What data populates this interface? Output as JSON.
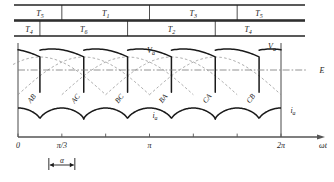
{
  "figure": {
    "type": "waveform-timing-diagram"
  },
  "thyristor_rows": {
    "upper": {
      "name": "upper-thyristor-row",
      "segments": [
        {
          "label": "T5",
          "start": 0.0,
          "end": 0.1667
        },
        {
          "label": "T1",
          "start": 0.1667,
          "end": 0.5
        },
        {
          "label": "T3",
          "start": 0.5,
          "end": 0.8333
        },
        {
          "label": "T5",
          "start": 0.8333,
          "end": 1.0
        }
      ]
    },
    "lower": {
      "name": "lower-thyristor-row",
      "segments": [
        {
          "label": "T4",
          "start": 0.0,
          "end": 0.0833
        },
        {
          "label": "T6",
          "start": 0.0833,
          "end": 0.4167
        },
        {
          "label": "T2",
          "start": 0.4167,
          "end": 0.75
        },
        {
          "label": "T4",
          "start": 0.75,
          "end": 1.0
        }
      ]
    }
  },
  "chart_data": {
    "type": "line",
    "title": "",
    "xlabel": "ωt",
    "ylabel": "",
    "xlim": [
      0,
      6.2832
    ],
    "grid": false,
    "x_ticks": [
      {
        "value": 0,
        "label": "0"
      },
      {
        "value": 1.0472,
        "label": "π/3"
      },
      {
        "value": 2.0944,
        "label": ""
      },
      {
        "value": 3.1416,
        "label": "π"
      },
      {
        "value": 4.1888,
        "label": ""
      },
      {
        "value": 5.236,
        "label": ""
      },
      {
        "value": 6.2832,
        "label": "2π"
      }
    ],
    "series": [
      {
        "name": "Va",
        "label": "Va",
        "style": "solid",
        "description": "rectified output voltage, 6 pulses per cycle, firing delay alpha"
      },
      {
        "name": "E",
        "label": "E",
        "style": "dash-dot",
        "description": "back-emf / average level reference line"
      },
      {
        "name": "ia",
        "label": "ia",
        "style": "solid",
        "description": "armature current, 6 ripple humps per cycle"
      },
      {
        "name": "line-to-line",
        "label": "",
        "style": "dashed",
        "description": "underlying line-to-line supply sinusoids"
      }
    ],
    "segment_labels": [
      "AB",
      "AC",
      "BC",
      "BA",
      "CA",
      "CB"
    ],
    "annotations": [
      {
        "name": "alpha-marker",
        "label": "α",
        "description": "firing-angle dimension marker below the axis"
      }
    ],
    "axis_labels": {
      "va": "V",
      "va_sub": "a",
      "e": "E",
      "ia": "i",
      "ia_sub": "a",
      "omega_t": "ωt"
    }
  },
  "colors": {
    "stroke": "#1a1a1a",
    "dashed": "#8a8a8a",
    "axis": "#555555",
    "frame": "#222222",
    "background": "#ffffff"
  }
}
